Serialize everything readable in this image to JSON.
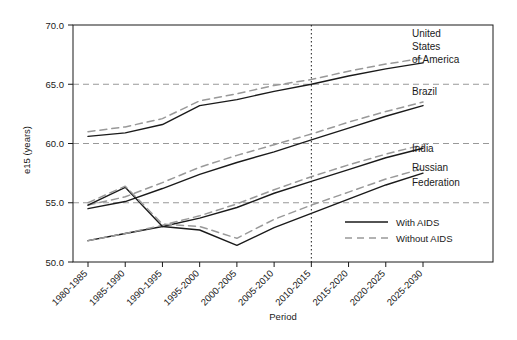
{
  "chart_data": {
    "type": "line",
    "title": "",
    "xlabel": "Period",
    "ylabel": "e15 (years)",
    "ylim": [
      50.0,
      70.0
    ],
    "yticks": [
      "50.0",
      "55.0",
      "60.0",
      "65.0",
      "70.0"
    ],
    "ytick_values": [
      50.0,
      55.0,
      60.0,
      65.0,
      70.0
    ],
    "grid": "horizontal dashed at 55.0, 60.0, 65.0; vertical dotted at 2010-2015",
    "grid_vertical_at": "2010-2015",
    "legend_position": "inside lower right",
    "categories": [
      "1980-1985",
      "1985-1990",
      "1990-1995",
      "1995-2000",
      "2000-2005",
      "2005-2010",
      "2010-2015",
      "2015-2020",
      "2020-2025",
      "2025-2030"
    ],
    "series": [
      {
        "name": "United States of America",
        "style": "With AIDS",
        "values": [
          60.6,
          60.9,
          61.6,
          63.2,
          63.7,
          64.4,
          65.0,
          65.7,
          66.3,
          66.8
        ]
      },
      {
        "name": "United States of America",
        "style": "Without AIDS",
        "values": [
          61.0,
          61.4,
          62.1,
          63.6,
          64.2,
          64.9,
          65.4,
          66.1,
          66.7,
          67.2
        ]
      },
      {
        "name": "Brazil",
        "style": "With AIDS",
        "values": [
          54.5,
          55.1,
          56.2,
          57.4,
          58.4,
          59.3,
          60.3,
          61.3,
          62.3,
          63.2
        ]
      },
      {
        "name": "Brazil",
        "style": "Without AIDS",
        "values": [
          54.8,
          55.5,
          56.7,
          58.0,
          59.0,
          59.9,
          60.8,
          61.8,
          62.7,
          63.5
        ]
      },
      {
        "name": "India",
        "style": "With AIDS",
        "values": [
          51.8,
          52.4,
          53.0,
          53.7,
          54.6,
          55.8,
          56.8,
          57.8,
          58.8,
          59.6
        ]
      },
      {
        "name": "India",
        "style": "Without AIDS",
        "values": [
          51.8,
          52.4,
          53.1,
          53.9,
          54.9,
          56.1,
          57.2,
          58.2,
          59.1,
          59.9
        ]
      },
      {
        "name": "Russian Federation",
        "style": "With AIDS",
        "values": [
          54.8,
          56.3,
          53.0,
          52.7,
          51.4,
          52.9,
          54.1,
          55.3,
          56.5,
          57.5
        ]
      },
      {
        "name": "Russian Federation",
        "style": "Without AIDS",
        "values": [
          55.0,
          56.4,
          53.2,
          53.0,
          52.0,
          53.6,
          54.8,
          55.9,
          57.0,
          57.9
        ]
      }
    ],
    "series_labels": [
      "United",
      "States",
      "of America",
      "Brazil",
      "India",
      "Russian",
      "Federation"
    ],
    "legend": [
      {
        "label": "With AIDS",
        "style": "solid",
        "color": "#1a1a1a"
      },
      {
        "label": "Without AIDS",
        "style": "dashed",
        "color": "#999999"
      }
    ],
    "colors": {
      "with_aids": "#1a1a1a",
      "without_aids": "#999999",
      "axis": "#1a1a1a",
      "grid": "#999999",
      "background": "#ffffff"
    }
  }
}
